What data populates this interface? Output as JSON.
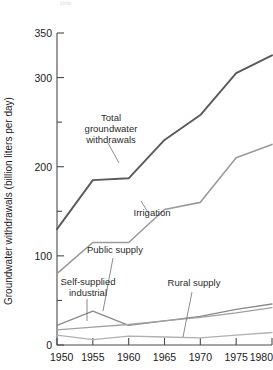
{
  "chart_data": {
    "type": "line",
    "title": "",
    "xlabel": "",
    "ylabel": "Groundwater withdrawals (billion liters per day)",
    "x": [
      1950,
      1955,
      1960,
      1965,
      1970,
      1975,
      1980
    ],
    "xtick_labels": [
      "1950",
      "1955",
      "1960",
      "1965",
      "1970",
      "1975",
      "1980"
    ],
    "xlim": [
      1950,
      1980
    ],
    "ylim": [
      0,
      350
    ],
    "ytick_labels": [
      "0",
      "100",
      "200",
      "300",
      "350"
    ],
    "ytick_values": [
      0,
      100,
      200,
      300,
      350
    ],
    "yminor_ticks": [
      50,
      150,
      250
    ],
    "grid": false,
    "legend_position": "inline-annotations",
    "series": [
      {
        "name": "Total groundwater withdrawals",
        "color": "#5a5a5a",
        "width": 1.9,
        "values": [
          130,
          185,
          187,
          230,
          258,
          305,
          325
        ]
      },
      {
        "name": "Irrigation",
        "color": "#9a9a9a",
        "width": 1.6,
        "values": [
          80,
          115,
          115,
          152,
          160,
          210,
          225
        ]
      },
      {
        "name": "Self-supplied industrial",
        "color": "#8a8a8a",
        "width": 1.3,
        "values": [
          22,
          38,
          22,
          27,
          32,
          40,
          46
        ]
      },
      {
        "name": "Public supply",
        "color": "#a0a0a0",
        "width": 1.3,
        "values": [
          17,
          20,
          23,
          27,
          31,
          36,
          42
        ]
      },
      {
        "name": "Rural supply",
        "color": "#b0b0b0",
        "width": 1.3,
        "values": [
          11,
          6,
          10,
          9,
          8,
          11,
          14
        ]
      }
    ],
    "annotations": [
      {
        "name": "total-groundwater-withdrawals",
        "lines": [
          "Total",
          "groundwater",
          "withdrawals"
        ],
        "text_x": 111,
        "text_y": 121,
        "leader": [
          [
            108,
            143
          ],
          [
            119,
            163
          ]
        ]
      },
      {
        "name": "irrigation",
        "lines": [
          "Irrigation"
        ],
        "text_x": 152,
        "text_y": 216,
        "leader": [
          [
            149,
            214
          ],
          [
            141,
            201
          ]
        ]
      },
      {
        "name": "public-supply",
        "lines": [
          "Public supply"
        ],
        "text_x": 115,
        "text_y": 253,
        "leader": [
          [
            113,
            258
          ],
          [
            103,
            311
          ]
        ]
      },
      {
        "name": "self-supplied-industrial",
        "lines": [
          "Self-supplied",
          "industrial"
        ],
        "text_x": 88,
        "text_y": 285,
        "leader": [
          [
            87,
            299
          ],
          [
            87,
            321
          ]
        ]
      },
      {
        "name": "rural-supply",
        "lines": [
          "Rural supply"
        ],
        "text_x": 194,
        "text_y": 286,
        "leader": [
          [
            192,
            292
          ],
          [
            183,
            337
          ]
        ]
      }
    ],
    "ghost_text": "Units"
  }
}
